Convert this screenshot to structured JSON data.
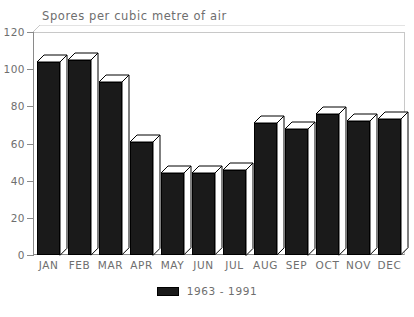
{
  "chart_data": {
    "type": "bar",
    "title": "Spores per cubic metre of air",
    "xlabel": "",
    "ylabel": "",
    "ylim": [
      0,
      120
    ],
    "yticks": [
      0,
      20,
      40,
      60,
      80,
      100,
      120
    ],
    "grid": false,
    "legend_position": "bottom-center",
    "categories": [
      "JAN",
      "FEB",
      "MAR",
      "APR",
      "MAY",
      "JUN",
      "JUL",
      "AUG",
      "SEP",
      "OCT",
      "NOV",
      "DEC"
    ],
    "series": [
      {
        "name": "1963 - 1991",
        "color": "#1a1a1a",
        "values": [
          104,
          105,
          93,
          61,
          44,
          44,
          46,
          71,
          68,
          76,
          72,
          73
        ]
      }
    ]
  },
  "legend": {
    "entries": [
      {
        "label": "1963 - 1991",
        "swatch": "legend-swatch-icon"
      }
    ]
  },
  "axis": {
    "y_tick_labels": [
      "120",
      "100",
      "80",
      "60",
      "40",
      "20",
      "0"
    ],
    "x_tick_labels": [
      "JAN",
      "FEB",
      "MAR",
      "APR",
      "MAY",
      "JUN",
      "JUL",
      "AUG",
      "SEP",
      "OCT",
      "NOV",
      "DEC"
    ]
  }
}
